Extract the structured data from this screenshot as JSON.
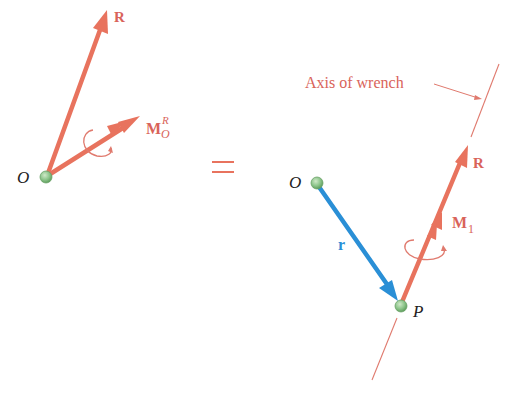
{
  "figure": {
    "type": "vector-diagram",
    "colors": {
      "force": "#e8735e",
      "force_dark": "#e0604a",
      "position_vector": "#2a8fd6",
      "point_fill": "#8cc48a",
      "point_stroke": "#5f9e5d",
      "label_dark": "#222222",
      "axis_label": "#d9635a",
      "axis_line": "#e07a6e"
    },
    "equals_sign": "=",
    "left": {
      "origin_label": "O",
      "force_label": "R",
      "moment_label_main": "M",
      "moment_label_sup": "R",
      "moment_label_sub": "O"
    },
    "right": {
      "origin_label": "O",
      "position_label": "r",
      "point_label": "P",
      "force_label": "R",
      "moment_label_main": "M",
      "moment_label_sub": "1",
      "axis_label": "Axis of wrench"
    }
  }
}
